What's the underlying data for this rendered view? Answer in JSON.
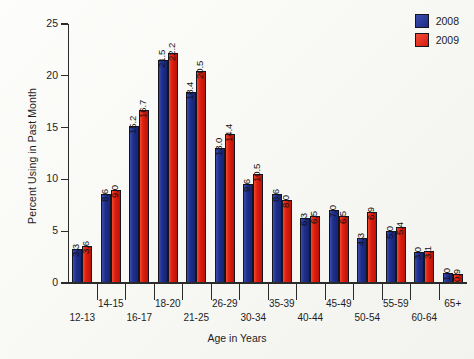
{
  "chart_data": {
    "type": "bar",
    "title": "",
    "xlabel": "Age in Years",
    "ylabel": "Percent Using in Past Month",
    "ylim": [
      0,
      25
    ],
    "yticks": [
      0,
      5,
      10,
      15,
      20,
      25
    ],
    "grid": false,
    "legend_position": "top-right",
    "categories": [
      "12-13",
      "14-15",
      "16-17",
      "18-20",
      "21-25",
      "26-29",
      "30-34",
      "35-39",
      "40-44",
      "45-49",
      "50-54",
      "55-59",
      "60-64",
      "65+"
    ],
    "series": [
      {
        "name": "2008",
        "color": "#1f2f8e",
        "values": [
          3.3,
          8.6,
          15.2,
          21.5,
          18.4,
          13.0,
          9.6,
          8.6,
          6.3,
          7.0,
          4.3,
          5.0,
          3.0,
          1.0
        ]
      },
      {
        "name": "2009",
        "color": "#e01d0d",
        "values": [
          3.6,
          9.0,
          16.7,
          22.2,
          20.5,
          14.4,
          10.5,
          8.0,
          6.5,
          6.5,
          6.9,
          5.4,
          3.1,
          0.9
        ]
      }
    ]
  },
  "legend": {
    "items": [
      {
        "label": "2008",
        "color": "#1f2f8e"
      },
      {
        "label": "2009",
        "color": "#e01d0d"
      }
    ]
  }
}
